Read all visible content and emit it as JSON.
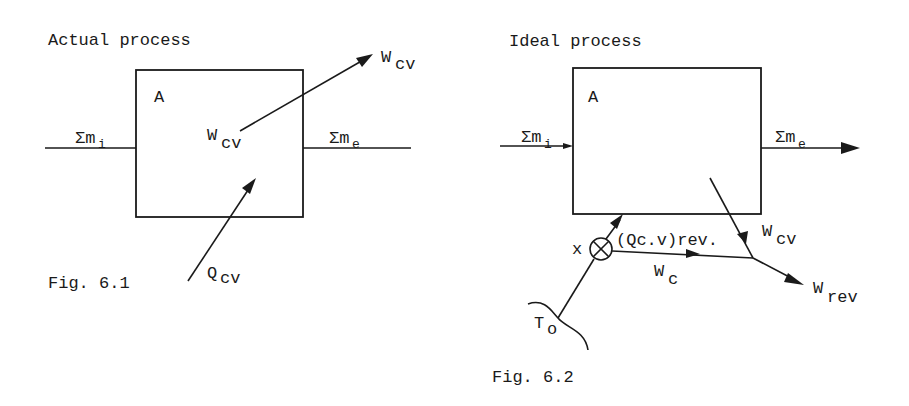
{
  "figures": [
    {
      "id": "fig-6-1",
      "title": "Actual process",
      "caption": "Fig. 6.1",
      "box_label": "A",
      "inflow": {
        "base": "Σm",
        "sub": "i"
      },
      "outflow": {
        "base": "Σm",
        "sub": "e"
      },
      "work_inner": {
        "base": "W",
        "sub": "cv"
      },
      "work_outer": {
        "base": "W",
        "sub": "cv"
      },
      "heat": {
        "base": "Q",
        "sub": "cv"
      }
    },
    {
      "id": "fig-6-2",
      "title": "Ideal process",
      "caption": "Fig. 6.2",
      "box_label": "A",
      "inflow": {
        "base": "Σm",
        "sub": "i"
      },
      "outflow": {
        "base": "Σm",
        "sub": "e"
      },
      "work_cv": {
        "base": "W",
        "sub": "cv"
      },
      "heat_rev": "(Qc.v)rev.",
      "work_c": {
        "base": "W",
        "sub": "c"
      },
      "work_rev": {
        "base": "W",
        "sub": "rev"
      },
      "engine_label": "x",
      "reservoir": {
        "base": "T",
        "sub": "o"
      }
    }
  ]
}
